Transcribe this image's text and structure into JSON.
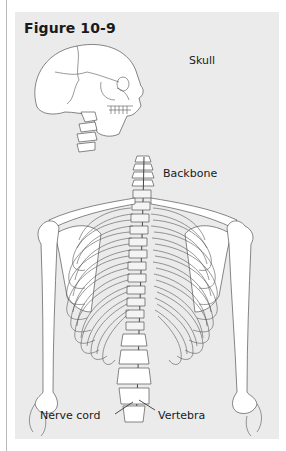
{
  "figure": {
    "title": "Figure 10-9",
    "labels": {
      "skull": "Skull",
      "backbone": "Backbone",
      "nerve_cord": "Nerve cord",
      "vertebra": "Vertebra"
    }
  },
  "colors": {
    "panel_background": "#ebebeb",
    "page_background": "#ffffff",
    "text": "#1a1a1a",
    "bone_fill": "#ffffff",
    "bone_outline": "#555555"
  }
}
